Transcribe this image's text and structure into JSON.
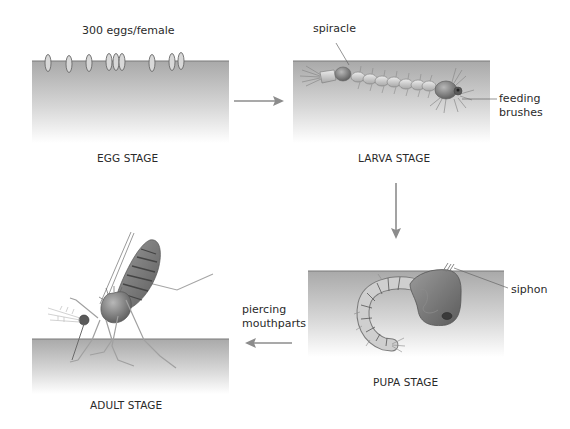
{
  "diagram": {
    "colors": {
      "water_top": "#a9a9a9",
      "water_bottom": "#ffffff",
      "water_surface_line": "#7a7a7a",
      "arrow": "#8c8c8c",
      "text": "#2a2a2a",
      "body_dark": "#6e6e6e",
      "body_light": "#cfcfcf"
    },
    "stages": [
      {
        "id": "egg",
        "label": "EGG STAGE",
        "annotation": "300 eggs/female"
      },
      {
        "id": "larva",
        "label": "LARVA STAGE",
        "callouts": [
          "spiracle",
          "feeding brushes"
        ]
      },
      {
        "id": "pupa",
        "label": "PUPA STAGE",
        "callouts": [
          "siphon"
        ]
      },
      {
        "id": "adult",
        "label": "ADULT STAGE",
        "callouts": [
          "piercing mouthparts"
        ]
      }
    ],
    "labels": {
      "egg_count": "300 eggs/female",
      "egg_stage": "EGG STAGE",
      "spiracle": "spiracle",
      "feeding_line1": "feeding",
      "feeding_line2": "brushes",
      "larva_stage": "LARVA STAGE",
      "siphon": "siphon",
      "pupa_stage": "PUPA STAGE",
      "piercing_line1": "piercing",
      "piercing_line2": "mouthparts",
      "adult_stage": "ADULT STAGE"
    },
    "flow": [
      {
        "from": "egg",
        "to": "larva",
        "direction": "right"
      },
      {
        "from": "larva",
        "to": "pupa",
        "direction": "down"
      },
      {
        "from": "pupa",
        "to": "adult",
        "direction": "left"
      }
    ]
  }
}
